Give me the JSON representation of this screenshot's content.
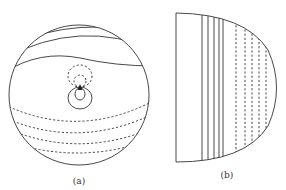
{
  "figure": {
    "panels": [
      {
        "id": "a",
        "label": "(a)",
        "shape": "circle",
        "description": "Circular domain with solid contour lines in upper half, dashed contour lines in lower half, and a point source near center with solid and dashed closed loops"
      },
      {
        "id": "b",
        "label": "(b)",
        "shape": "half-disk",
        "description": "Half-disk domain with vertical solid lines on left portion and vertical dashed lines on right portion"
      }
    ],
    "legend": {
      "solid": "solid-contour",
      "dashed": "dashed-contour"
    },
    "colors": {
      "stroke": "#333333",
      "background": "#ffffff"
    }
  }
}
